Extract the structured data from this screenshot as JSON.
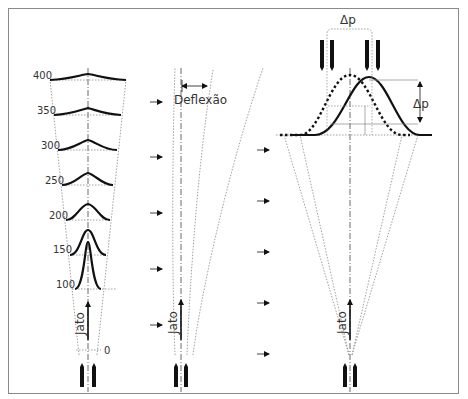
{
  "figure": {
    "border_color": "#8a8a8a",
    "ink_color": "#111111",
    "guide_color": "#888888",
    "label_color": "#333333"
  },
  "panel_left": {
    "distance_labels": [
      "400",
      "350",
      "300",
      "250",
      "200",
      "150",
      "100",
      "0"
    ],
    "jet_label": "Jato"
  },
  "panel_middle": {
    "deflection_label": "Deflexão",
    "jet_label": "Jato"
  },
  "panel_right": {
    "delta_p_top_label": "Δp",
    "delta_p_side_label": "Δp",
    "jet_label": "Jato"
  }
}
